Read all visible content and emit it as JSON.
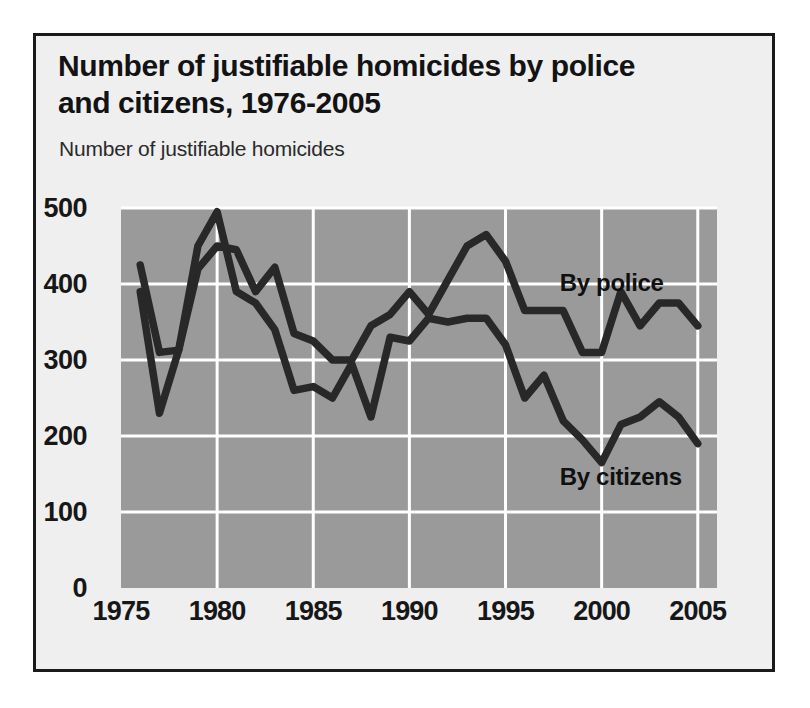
{
  "figure": {
    "title": "Number of justifiable homicides by police and citizens, 1976-2005",
    "title_line1": "Number of justifiable homicides by police",
    "title_line2": "and citizens, 1976-2005",
    "y_axis_title": "Number of justifiable homicides",
    "background_color": "#efefef",
    "frame_color": "#1a1a1a",
    "plot_background_color": "#9a9a9a",
    "gridline_color": "#ffffff",
    "series_color": "#282828"
  },
  "chart_data": {
    "type": "line",
    "title": "Number of justifiable homicides by police and citizens, 1976-2005",
    "subtitle": "",
    "xlabel": "",
    "ylabel": "Number of justifiable homicides",
    "xlim": [
      1975,
      2006
    ],
    "ylim": [
      0,
      500
    ],
    "xticks": [
      1975,
      1980,
      1985,
      1990,
      1995,
      2000,
      2005
    ],
    "xtick_labels": [
      "1975",
      "1980",
      "1985",
      "1990",
      "1995",
      "2000",
      "2005"
    ],
    "yticks": [
      0,
      100,
      200,
      300,
      400,
      500
    ],
    "ytick_labels": [
      "0",
      "100",
      "200",
      "300",
      "400",
      "500"
    ],
    "grid": true,
    "legend_position": "inline-annotation",
    "x": [
      1976,
      1977,
      1978,
      1979,
      1980,
      1981,
      1982,
      1983,
      1984,
      1985,
      1986,
      1987,
      1988,
      1989,
      1990,
      1991,
      1992,
      1993,
      1994,
      1995,
      1996,
      1997,
      1998,
      1999,
      2000,
      2001,
      2002,
      2003,
      2004,
      2005
    ],
    "series": [
      {
        "name": "By police",
        "label": "By police",
        "color": "#282828",
        "values": [
          425,
          310,
          313,
          420,
          450,
          445,
          390,
          422,
          335,
          325,
          300,
          300,
          345,
          360,
          390,
          360,
          405,
          450,
          465,
          430,
          365,
          365,
          365,
          310,
          310,
          390,
          345,
          375,
          375,
          345
        ]
      },
      {
        "name": "By citizens",
        "label": "By citizens",
        "color": "#282828",
        "values": [
          390,
          230,
          313,
          450,
          495,
          390,
          375,
          340,
          260,
          265,
          250,
          295,
          225,
          330,
          325,
          355,
          350,
          355,
          355,
          320,
          250,
          280,
          220,
          195,
          165,
          215,
          225,
          245,
          225,
          190
        ]
      }
    ],
    "annotations": [
      {
        "text": "By police",
        "x": 2000,
        "y": 400
      },
      {
        "text": "By citizens",
        "x": 2000,
        "y": 145
      }
    ]
  },
  "y_ticks": [
    {
      "label": "500",
      "value": 500
    },
    {
      "label": "400",
      "value": 400
    },
    {
      "label": "300",
      "value": 300
    },
    {
      "label": "200",
      "value": 200
    },
    {
      "label": "100",
      "value": 100
    },
    {
      "label": "0",
      "value": 0
    }
  ],
  "x_ticks": [
    {
      "label": "1975",
      "value": 1975
    },
    {
      "label": "1980",
      "value": 1980
    },
    {
      "label": "1985",
      "value": 1985
    },
    {
      "label": "1990",
      "value": 1990
    },
    {
      "label": "1995",
      "value": 1995
    },
    {
      "label": "2000",
      "value": 2000
    },
    {
      "label": "2005",
      "value": 2005
    }
  ]
}
